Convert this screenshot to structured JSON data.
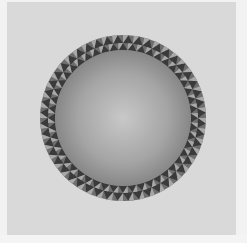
{
  "image": {
    "subject": "sphere-with-triangular-pattern-ring",
    "colors": {
      "background": "#d9d9d9",
      "frame": "#f2f2f2",
      "sphere_highlight": "#c8c8c8",
      "sphere_shadow": "#8a8a8a",
      "ring_dark": "#3a3a3a",
      "ring_light": "#a8a8a8",
      "ring_mid": "#6e6e6e"
    },
    "geometry": {
      "center_x": 123,
      "center_y": 118,
      "outer_radius": 83,
      "middle_radius": 75,
      "inner_radius": 68,
      "triangle_count": 48
    }
  }
}
